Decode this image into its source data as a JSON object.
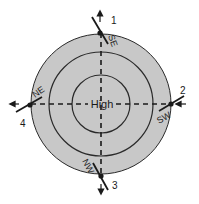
{
  "diagram": {
    "center_label": "High",
    "colors": {
      "fill": "#c8c8c8",
      "stroke": "#2a2a2a",
      "background": "#ffffff"
    },
    "points": [
      {
        "number": "1",
        "wind": "SE",
        "position": "top"
      },
      {
        "number": "2",
        "wind": "SW",
        "position": "right"
      },
      {
        "number": "3",
        "wind": "NW",
        "position": "bottom"
      },
      {
        "number": "4",
        "wind": "NE",
        "position": "left"
      }
    ]
  }
}
